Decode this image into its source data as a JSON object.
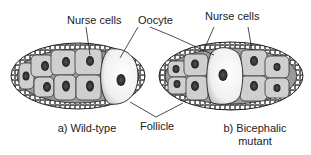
{
  "labels": {
    "nurse_cells_a": "Nurse cells",
    "oocyte": "Oocyte",
    "nurse_cells_b": "Nurse cells",
    "follicle": "Follicle"
  },
  "captions": {
    "a": "a) Wild-type",
    "b_line1": "b) Bicephalic",
    "b_line2": "mutant"
  },
  "panels": [
    {
      "id": "a",
      "name": "Wild-type",
      "structure": "nurse cells (8 visible) at anterior-left, single oocyte at posterior-right, surrounded by follicle cell layer"
    },
    {
      "id": "b",
      "name": "Bicephalic mutant",
      "structure": "oocyte in center, nurse cells on both sides (4 left, 4 right), surrounded by follicle cell layer"
    }
  ],
  "colors": {
    "ink": "#222222",
    "cell_fill": "#c9c9c9",
    "nucleus": "#2a2a2a",
    "oocyte_fill": "#f4f4f4",
    "background": "#ffffff"
  }
}
